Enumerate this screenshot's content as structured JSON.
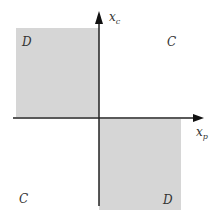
{
  "diagram": {
    "axes": {
      "x": {
        "label": "x",
        "subscript": "p"
      },
      "y": {
        "label": "x",
        "subscript": "c"
      }
    },
    "quadrants": {
      "top_left": {
        "label": "D",
        "shaded": true
      },
      "top_right": {
        "label": "C",
        "shaded": false
      },
      "bottom_left": {
        "label": "C",
        "shaded": false
      },
      "bottom_right": {
        "label": "D",
        "shaded": true
      }
    },
    "colors": {
      "shade": "#d6d6d6",
      "axis": "#222222"
    }
  }
}
